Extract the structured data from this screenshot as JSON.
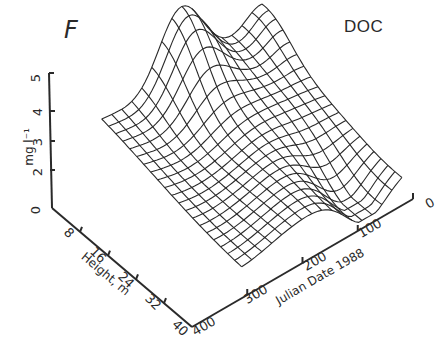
{
  "panel_label": "F",
  "chart_data": {
    "type": "surface",
    "title": "DOC",
    "panel": "F",
    "axes": {
      "z": {
        "label": "mg l⁻¹",
        "ticks": [
          "0",
          "2",
          "3",
          "4",
          "5"
        ],
        "range": [
          0,
          5
        ]
      },
      "y": {
        "label": "Height, m",
        "ticks": [
          "0",
          "8",
          "16",
          "24",
          "32",
          "40"
        ],
        "range": [
          0,
          40
        ]
      },
      "x": {
        "label": "Julian Date 1988",
        "ticks": [
          "0",
          "100",
          "200",
          "300",
          "400"
        ],
        "range": [
          0,
          400
        ]
      }
    },
    "grid": false,
    "mesh_rows": 20,
    "mesh_cols": 16
  },
  "colors": {
    "line": "#2a2a2a",
    "background": "#ffffff"
  }
}
